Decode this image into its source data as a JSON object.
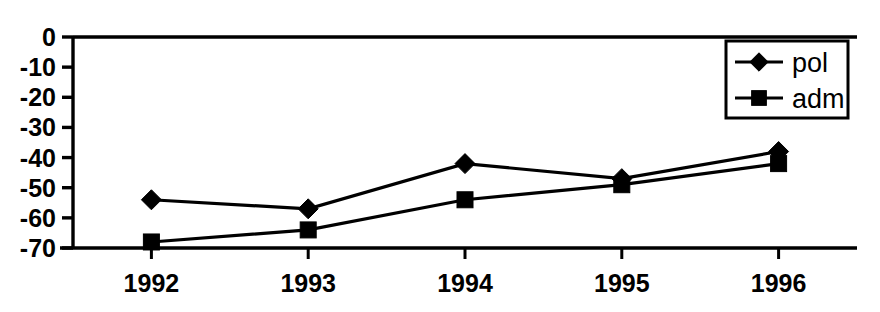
{
  "chart_data": {
    "type": "line",
    "title": "",
    "subtitle": "",
    "xlabel": "",
    "ylabel": "",
    "categories": [
      "1992",
      "1993",
      "1994",
      "1995",
      "1996"
    ],
    "series": [
      {
        "name": "pol",
        "marker": "diamond",
        "values": [
          -54,
          -57,
          -42,
          -47,
          -38
        ]
      },
      {
        "name": "adm",
        "marker": "square",
        "values": [
          -68,
          -64,
          -54,
          -49,
          -42
        ]
      }
    ],
    "ylim": [
      -70,
      0
    ],
    "yticks": [
      0,
      -10,
      -20,
      -30,
      -40,
      -50,
      -60,
      -70
    ],
    "ytick_labels": [
      "0",
      "-10",
      "-20",
      "-30",
      "-40",
      "-50",
      "-60",
      "-70"
    ],
    "grid": false,
    "legend_position": "top-right",
    "legend_entries": [
      "pol",
      "adm"
    ],
    "colors": {
      "line": "#000000",
      "marker": "#000000",
      "axis": "#000000",
      "background": "#ffffff"
    }
  },
  "legend": {
    "items": [
      {
        "label": "pol",
        "marker": "diamond-marker"
      },
      {
        "label": "adm",
        "marker": "square-marker"
      }
    ]
  },
  "y_axis": {
    "labels": [
      "0",
      "-10",
      "-20",
      "-30",
      "-40",
      "-50",
      "-60",
      "-70"
    ]
  },
  "x_axis": {
    "labels": [
      "1992",
      "1993",
      "1994",
      "1995",
      "1996"
    ]
  }
}
